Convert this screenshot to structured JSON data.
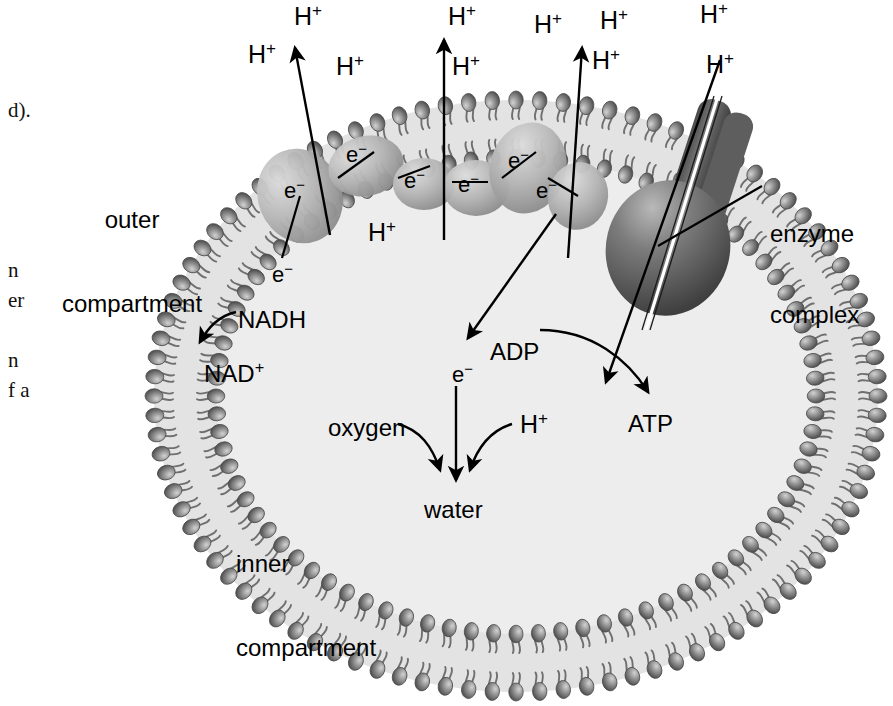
{
  "figure": {
    "type": "biology-cell-diagram"
  },
  "body_text_fragments": [
    {
      "text": "d).",
      "x": 8,
      "y": 98
    },
    {
      "text": "n",
      "x": 8,
      "y": 258
    },
    {
      "text": "er",
      "x": 8,
      "y": 288
    },
    {
      "text": "",
      "x": 8,
      "y": 318
    },
    {
      "text": "n",
      "x": 8,
      "y": 348
    },
    {
      "text": "f a",
      "x": 8,
      "y": 378
    }
  ],
  "regions": {
    "outer_compartment": {
      "line1": "outer",
      "line2": "compartment",
      "x": 62,
      "y": 150
    },
    "inner_compartment": {
      "line1": "inner",
      "line2": "compartment",
      "x": 236,
      "y": 494
    }
  },
  "callouts": {
    "enzyme_complex": {
      "line1": "enzyme",
      "line2": "complex",
      "x": 770,
      "y": 166
    }
  },
  "proton_labels": [
    {
      "id": "h-top-1",
      "text": "H",
      "charge": "+",
      "x": 294,
      "y": 2
    },
    {
      "id": "h-top-2",
      "text": "H",
      "charge": "+",
      "x": 448,
      "y": 2
    },
    {
      "id": "h-top-3",
      "text": "H",
      "charge": "+",
      "x": 534,
      "y": 10
    },
    {
      "id": "h-top-4",
      "text": "H",
      "charge": "+",
      "x": 600,
      "y": 6
    },
    {
      "id": "h-top-5",
      "text": "H",
      "charge": "+",
      "x": 700,
      "y": 0
    },
    {
      "id": "h-left-out",
      "text": "H",
      "charge": "+",
      "x": 248,
      "y": 40
    },
    {
      "id": "h-mid-a",
      "text": "H",
      "charge": "+",
      "x": 336,
      "y": 52
    },
    {
      "id": "h-mid-b",
      "text": "H",
      "charge": "+",
      "x": 452,
      "y": 52
    },
    {
      "id": "h-mid-c",
      "text": "H",
      "charge": "+",
      "x": 592,
      "y": 46
    },
    {
      "id": "h-right-syn",
      "text": "H",
      "charge": "+",
      "x": 706,
      "y": 50
    },
    {
      "id": "h-inner-pump",
      "text": "H",
      "charge": "+",
      "x": 368,
      "y": 218
    },
    {
      "id": "h-water",
      "text": "H",
      "charge": "+",
      "x": 520,
      "y": 410
    }
  ],
  "electron_labels": [
    {
      "id": "e-carrier-1",
      "text": "e",
      "charge": "−",
      "x": 284,
      "y": 178
    },
    {
      "id": "e-carrier-2",
      "text": "e",
      "charge": "−",
      "x": 346,
      "y": 142
    },
    {
      "id": "e-carrier-3",
      "text": "e",
      "charge": "−",
      "x": 404,
      "y": 168
    },
    {
      "id": "e-carrier-4",
      "text": "e",
      "charge": "−",
      "x": 458,
      "y": 172
    },
    {
      "id": "e-carrier-5",
      "text": "e",
      "charge": "−",
      "x": 508,
      "y": 148
    },
    {
      "id": "e-carrier-6",
      "text": "e",
      "charge": "−",
      "x": 536,
      "y": 178
    },
    {
      "id": "e-from-nadh",
      "text": "e",
      "charge": "−",
      "x": 272,
      "y": 262
    },
    {
      "id": "e-to-oxygen",
      "text": "e",
      "charge": "−",
      "x": 452,
      "y": 362
    }
  ],
  "molecules": [
    {
      "id": "nadh",
      "text": "NADH",
      "x": 238,
      "y": 306
    },
    {
      "id": "nad-plus",
      "text": "NAD",
      "charge": "+",
      "x": 204,
      "y": 360
    },
    {
      "id": "adp",
      "text": "ADP",
      "x": 490,
      "y": 338
    },
    {
      "id": "atp",
      "text": "ATP",
      "x": 628,
      "y": 410
    },
    {
      "id": "oxygen",
      "text": "oxygen",
      "x": 328,
      "y": 414
    },
    {
      "id": "water",
      "text": "water",
      "x": 424,
      "y": 496
    }
  ],
  "colors": {
    "membrane_head": "#8d8d8d",
    "membrane_head_dark": "#5b5b5b",
    "membrane_tail": "#6f6f6f",
    "inner_fill": "#ededed",
    "bilayer_fill": "#e2e2e2",
    "carrier_protein": "#b6b6b6",
    "enzyme_complex": "#6e6e6e",
    "enzyme_complex_dark": "#4a4a4a",
    "arrow": "#000000",
    "text": "#000000",
    "background": "#ffffff"
  },
  "structure": {
    "outer_membrane_label": "outer membrane bilayer",
    "inner_membrane_label": "inner membrane bilayer",
    "carrier_count": 5,
    "pump_arrow_count": 3,
    "enzyme_complex_parts": [
      "stalk",
      "globular-head",
      "proton-channel"
    ]
  }
}
